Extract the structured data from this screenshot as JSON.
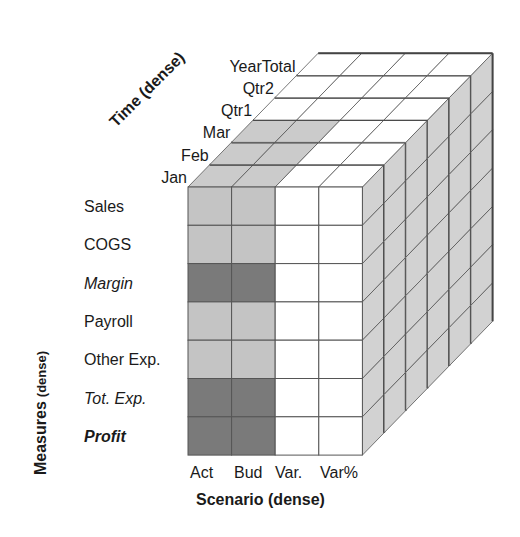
{
  "diagram": {
    "axes": {
      "measures": {
        "label": "Measures",
        "qualifier": "(dense)"
      },
      "time": {
        "label": "Time (dense)"
      },
      "scenario": {
        "label": "Scenario (dense)"
      }
    },
    "measures": [
      {
        "label": "Sales",
        "style": "normal",
        "shade": "light"
      },
      {
        "label": "COGS",
        "style": "normal",
        "shade": "light"
      },
      {
        "label": "Margin",
        "style": "italic",
        "shade": "dark"
      },
      {
        "label": "Payroll",
        "style": "normal",
        "shade": "light"
      },
      {
        "label": "Other Exp.",
        "style": "normal",
        "shade": "light"
      },
      {
        "label": "Tot. Exp.",
        "style": "italic",
        "shade": "dark"
      },
      {
        "label": "Profit",
        "style": "bolditalic",
        "shade": "dark"
      }
    ],
    "scenarios": [
      {
        "label": "Act",
        "shaded": true
      },
      {
        "label": "Bud",
        "shaded": true
      },
      {
        "label": "Var.",
        "shaded": false
      },
      {
        "label": "Var%",
        "shaded": false
      }
    ],
    "time": [
      {
        "label": "Jan",
        "shaded": true
      },
      {
        "label": "Feb",
        "shaded": true
      },
      {
        "label": "Mar",
        "shaded": true
      },
      {
        "label": "Qtr1",
        "shaded": false
      },
      {
        "label": "Qtr2",
        "shaded": false
      },
      {
        "label": "YearTotal",
        "shaded": false
      }
    ],
    "colors": {
      "light": "#c4c4c4",
      "dark": "#7a7a7a",
      "side": "#d2d2d2",
      "top_shaded": "#cbcbcb",
      "white": "#ffffff",
      "line": "#555555",
      "thick_line": "#444444"
    }
  }
}
